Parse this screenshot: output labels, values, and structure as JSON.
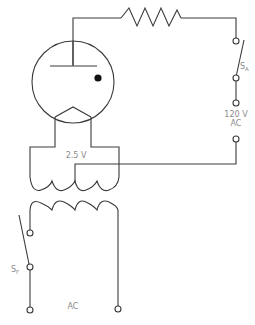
{
  "diagram": {
    "type": "vacuum-tube-circuit",
    "components": {
      "tube": {
        "name": "vacuum tube",
        "elements": [
          "plate",
          "grid-dot",
          "filament"
        ]
      },
      "resistor": {
        "name": "plate resistor"
      },
      "switch_anode": {
        "label": "S",
        "subscript": "A"
      },
      "switch_filament": {
        "label": "S",
        "subscript": "F"
      },
      "filament_transformer": {
        "secondary_label": "2.5 V"
      }
    },
    "labels": {
      "plate_supply_voltage": "120 V",
      "plate_supply_type": "AC",
      "filament_voltage": "2.5 V",
      "primary_supply": "AC"
    },
    "colors": {
      "line": "#3a3a3a",
      "label": "#8a8a8a",
      "dot": "#111111",
      "background": "#ffffff"
    }
  }
}
